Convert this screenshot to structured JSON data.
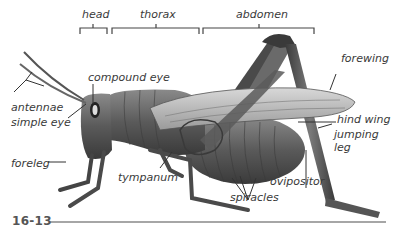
{
  "figure": {
    "number": "16-13"
  },
  "regions": [
    {
      "label": "head"
    },
    {
      "label": "thorax"
    },
    {
      "label": "abdomen"
    }
  ],
  "labels": {
    "compound_eye": "compound eye",
    "antennae": "antennae",
    "simple_eye": "simple eye",
    "foreleg": "foreleg",
    "tympanum": "tympanum",
    "spiracles": "spiracles",
    "ovipositor": "ovipositor",
    "forewing": "forewing",
    "hind_wing": "hind wing",
    "jumping_leg_1": "jumping",
    "jumping_leg_2": "leg"
  },
  "colors": {
    "label_text": "#3a3a3a",
    "line": "#444444",
    "figure_rule": "#888888"
  }
}
